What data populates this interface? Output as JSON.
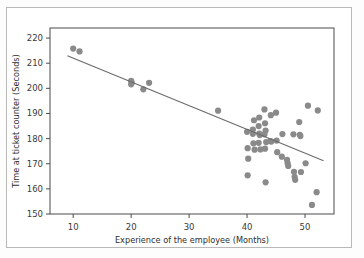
{
  "figure": {
    "background": "#ffffff",
    "border_color": "#b9b9b9",
    "frame_color": "#4a4a4a"
  },
  "chart_data": {
    "type": "scatter",
    "title": "",
    "xlabel": "Experience of the employee (Months)",
    "ylabel": "Time at ticket counter (Seconds)",
    "xlim": [
      6,
      55
    ],
    "ylim": [
      150,
      224
    ],
    "xticks": [
      10,
      20,
      30,
      40,
      50
    ],
    "yticks": [
      150,
      160,
      170,
      180,
      190,
      200,
      210,
      220
    ],
    "xtick_labels": [
      "10",
      "20",
      "30",
      "40",
      "50"
    ],
    "ytick_labels": [
      "150",
      "160",
      "170",
      "180",
      "190",
      "200",
      "210",
      "220"
    ],
    "grid": false,
    "legend": null,
    "marker_color": "#8a8a8a",
    "marker_size": 3.1,
    "line_color": "#6b6b6b",
    "points": [
      {
        "x": 10.0,
        "y": 215.8
      },
      {
        "x": 11.1,
        "y": 214.7
      },
      {
        "x": 20.0,
        "y": 203.0
      },
      {
        "x": 20.0,
        "y": 201.6
      },
      {
        "x": 20.1,
        "y": 202.3
      },
      {
        "x": 22.1,
        "y": 199.6
      },
      {
        "x": 23.1,
        "y": 202.2
      },
      {
        "x": 35.0,
        "y": 191.1
      },
      {
        "x": 40.0,
        "y": 182.7
      },
      {
        "x": 40.1,
        "y": 176.2
      },
      {
        "x": 40.2,
        "y": 172.0
      },
      {
        "x": 40.1,
        "y": 165.4
      },
      {
        "x": 41.0,
        "y": 183.6
      },
      {
        "x": 41.0,
        "y": 181.9
      },
      {
        "x": 41.2,
        "y": 187.3
      },
      {
        "x": 41.1,
        "y": 178.1
      },
      {
        "x": 41.3,
        "y": 175.6
      },
      {
        "x": 42.0,
        "y": 185.0
      },
      {
        "x": 42.1,
        "y": 182.0
      },
      {
        "x": 42.2,
        "y": 181.4
      },
      {
        "x": 42.0,
        "y": 178.3
      },
      {
        "x": 42.3,
        "y": 175.7
      },
      {
        "x": 42.1,
        "y": 188.4
      },
      {
        "x": 43.0,
        "y": 191.6
      },
      {
        "x": 43.1,
        "y": 186.1
      },
      {
        "x": 43.2,
        "y": 183.2
      },
      {
        "x": 43.0,
        "y": 181.7
      },
      {
        "x": 43.3,
        "y": 178.6
      },
      {
        "x": 43.1,
        "y": 176.0
      },
      {
        "x": 43.2,
        "y": 162.6
      },
      {
        "x": 44.1,
        "y": 189.3
      },
      {
        "x": 44.0,
        "y": 179.0
      },
      {
        "x": 44.2,
        "y": 178.8
      },
      {
        "x": 45.0,
        "y": 190.3
      },
      {
        "x": 45.1,
        "y": 179.2
      },
      {
        "x": 45.2,
        "y": 174.6
      },
      {
        "x": 46.1,
        "y": 181.8
      },
      {
        "x": 46.0,
        "y": 172.8
      },
      {
        "x": 46.9,
        "y": 171.5
      },
      {
        "x": 47.0,
        "y": 170.2
      },
      {
        "x": 47.1,
        "y": 169.1
      },
      {
        "x": 48.0,
        "y": 181.7
      },
      {
        "x": 48.1,
        "y": 166.8
      },
      {
        "x": 48.2,
        "y": 164.8
      },
      {
        "x": 48.3,
        "y": 163.6
      },
      {
        "x": 49.0,
        "y": 186.6
      },
      {
        "x": 49.1,
        "y": 181.5
      },
      {
        "x": 49.2,
        "y": 181.0
      },
      {
        "x": 49.3,
        "y": 166.7
      },
      {
        "x": 50.1,
        "y": 170.2
      },
      {
        "x": 50.5,
        "y": 193.1
      },
      {
        "x": 51.2,
        "y": 153.6
      },
      {
        "x": 52.2,
        "y": 191.2
      },
      {
        "x": 52.0,
        "y": 158.7
      }
    ],
    "trend_line": {
      "x_start": 9.0,
      "y_start": 213.0,
      "x_end": 53.2,
      "y_end": 171.2
    }
  }
}
